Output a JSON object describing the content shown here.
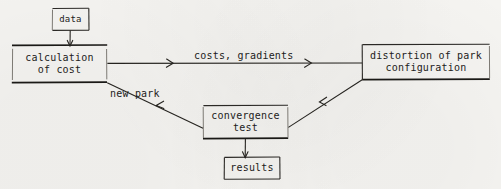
{
  "diagram": {
    "ink_color": "#1d1c1b",
    "paper_color": "#f7f6f3",
    "nodes": [
      {
        "id": "data",
        "label": "data"
      },
      {
        "id": "calculation",
        "label": "calculation\nof cost"
      },
      {
        "id": "distortion",
        "label": "distortion of park\nconfiguration"
      },
      {
        "id": "convergence",
        "label": "convergence\ntest"
      },
      {
        "id": "results",
        "label": "results"
      }
    ],
    "edge_labels": [
      {
        "id": "costs-gradients",
        "label": "costs, gradients"
      },
      {
        "id": "new-park",
        "label": "new park"
      }
    ],
    "edges": [
      {
        "from": "data",
        "to": "calculation",
        "label": ""
      },
      {
        "from": "calculation",
        "to": "distortion",
        "label": "costs, gradients"
      },
      {
        "from": "distortion",
        "to": "convergence",
        "label": ""
      },
      {
        "from": "convergence",
        "to": "calculation",
        "label": "new park"
      },
      {
        "from": "convergence",
        "to": "results",
        "label": ""
      }
    ]
  }
}
